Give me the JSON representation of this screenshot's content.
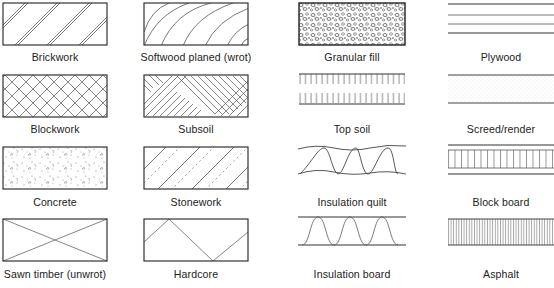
{
  "columns": [
    {
      "items": [
        {
          "id": "brickwork",
          "label": "Brickwork",
          "pattern": "double-diagonal-hatch"
        },
        {
          "id": "blockwork",
          "label": "Blockwork",
          "pattern": "cross-hatch"
        },
        {
          "id": "concrete",
          "label": "Concrete",
          "pattern": "stipple-aggregate"
        },
        {
          "id": "sawn-timber",
          "label": "Sawn timber (unwrot)",
          "pattern": "x-cross"
        }
      ]
    },
    {
      "items": [
        {
          "id": "softwood-planed",
          "label": "Softwood planed (wrot)",
          "pattern": "curved-grain"
        },
        {
          "id": "subsoil",
          "label": "Subsoil",
          "pattern": "herringbone-hatch"
        },
        {
          "id": "stonework",
          "label": "Stonework",
          "pattern": "diagonal-with-dashes"
        },
        {
          "id": "hardcore",
          "label": "Hardcore",
          "pattern": "zigzag"
        }
      ]
    },
    {
      "items": [
        {
          "id": "granular-fill",
          "label": "Granular fill",
          "pattern": "dense-pebbles"
        },
        {
          "id": "top-soil",
          "label": "Top soil",
          "pattern": "comb-ticks"
        },
        {
          "id": "insulation-quilt",
          "label": "Insulation quilt",
          "pattern": "wavy-loops"
        },
        {
          "id": "insulation-board",
          "label": "Insulation board",
          "pattern": "bell-waves"
        }
      ]
    },
    {
      "items": [
        {
          "id": "plywood",
          "label": "Plywood",
          "pattern": "horizontal-lines"
        },
        {
          "id": "screed-render",
          "label": "Screed/render",
          "pattern": "fine-dots"
        },
        {
          "id": "block-board",
          "label": "Block board",
          "pattern": "vertical-strips"
        },
        {
          "id": "asphalt",
          "label": "Asphalt",
          "pattern": "dense-vertical-lines"
        }
      ]
    }
  ],
  "colors": {
    "line": "#333333",
    "fill": "#ffffff",
    "text": "#222222"
  }
}
